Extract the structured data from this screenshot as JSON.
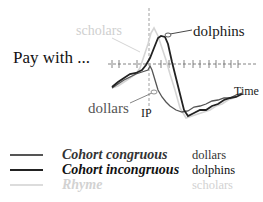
{
  "figure": {
    "prompt": "Pay with ...",
    "ip_label": "IP",
    "time_label": "Time"
  },
  "annotations": {
    "scholars": "scholars",
    "dolphins": "dolphins",
    "dollars": "dollars"
  },
  "legend": [
    {
      "name": "Cohort congruous",
      "word": "dollars",
      "color": "#555555"
    },
    {
      "name": "Cohort incongruous",
      "word": "dolphins",
      "color": "#222222"
    },
    {
      "name": "Rhyme",
      "word": "scholars",
      "color": "#d4d4d4"
    }
  ],
  "chart_data": {
    "type": "line",
    "title": "Pay with ...",
    "xlabel": "Time",
    "ylabel": "",
    "annotations": [
      "IP",
      "scholars",
      "dolphins",
      "dollars"
    ],
    "legend_position": "bottom-left",
    "grid": false,
    "series": [
      {
        "name": "Cohort congruous (dollars)",
        "color": "#555555",
        "points": [
          [
            112,
            88
          ],
          [
            118,
            84
          ],
          [
            124,
            80
          ],
          [
            130,
            77
          ],
          [
            136,
            74
          ],
          [
            142,
            72
          ],
          [
            148,
            70
          ],
          [
            150,
            66
          ],
          [
            152,
            70
          ],
          [
            155,
            80
          ],
          [
            158,
            90
          ],
          [
            162,
            97
          ],
          [
            166,
            102
          ],
          [
            170,
            106
          ],
          [
            176,
            110
          ],
          [
            182,
            112
          ],
          [
            188,
            111
          ],
          [
            194,
            107
          ],
          [
            200,
            106
          ],
          [
            206,
            104
          ],
          [
            212,
            101
          ],
          [
            218,
            100
          ],
          [
            224,
            98
          ],
          [
            230,
            98
          ],
          [
            236,
            95
          ],
          [
            242,
            93
          ]
        ]
      },
      {
        "name": "Cohort incongruous (dolphins)",
        "color": "#222222",
        "points": [
          [
            112,
            87
          ],
          [
            118,
            82
          ],
          [
            124,
            78
          ],
          [
            130,
            74
          ],
          [
            136,
            73
          ],
          [
            142,
            70
          ],
          [
            146,
            65
          ],
          [
            150,
            58
          ],
          [
            154,
            48
          ],
          [
            158,
            38
          ],
          [
            161,
            36
          ],
          [
            165,
            37
          ],
          [
            168,
            44
          ],
          [
            172,
            62
          ],
          [
            176,
            78
          ],
          [
            180,
            94
          ],
          [
            184,
            110
          ],
          [
            188,
            116
          ],
          [
            194,
            113
          ],
          [
            200,
            110
          ],
          [
            206,
            110
          ],
          [
            212,
            106
          ],
          [
            218,
            104
          ],
          [
            224,
            100
          ],
          [
            230,
            98
          ],
          [
            236,
            97
          ],
          [
            242,
            94
          ]
        ]
      },
      {
        "name": "Rhyme (scholars)",
        "color": "#d4d4d4",
        "points": [
          [
            112,
            88
          ],
          [
            118,
            86
          ],
          [
            124,
            82
          ],
          [
            130,
            78
          ],
          [
            136,
            74
          ],
          [
            140,
            68
          ],
          [
            144,
            56
          ],
          [
            148,
            44
          ],
          [
            151,
            33
          ],
          [
            154,
            28
          ],
          [
            158,
            36
          ],
          [
            162,
            48
          ],
          [
            166,
            60
          ],
          [
            170,
            74
          ],
          [
            175,
            90
          ],
          [
            180,
            108
          ],
          [
            186,
            118
          ],
          [
            192,
            116
          ],
          [
            198,
            114
          ],
          [
            204,
            112
          ],
          [
            210,
            110
          ],
          [
            216,
            106
          ],
          [
            222,
            104
          ],
          [
            228,
            100
          ],
          [
            236,
            97
          ],
          [
            242,
            94
          ]
        ]
      }
    ],
    "baseline_y": 64,
    "ip_x": 149
  }
}
